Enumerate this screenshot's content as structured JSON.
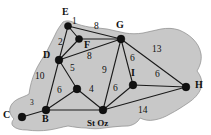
{
  "figure": {
    "type": "weighted-graph-map",
    "background_color": "#ffffff",
    "landmass_color": "#c8c8c8",
    "edge_color": "#1a1a1a",
    "node_color": "#111111",
    "width": 211,
    "height": 135
  },
  "graph": {
    "nodes": [
      {
        "id": "E",
        "label": "E",
        "x": 68,
        "y": 26,
        "label_x": 62,
        "label_y": 9,
        "r": 3.6
      },
      {
        "id": "F",
        "label": "F",
        "x": 79,
        "y": 39,
        "label_x": 84,
        "label_y": 42,
        "r": 3.6
      },
      {
        "id": "G",
        "label": "G",
        "x": 121,
        "y": 39,
        "label_x": 117,
        "label_y": 22,
        "r": 3.9
      },
      {
        "id": "D",
        "label": "D",
        "x": 59,
        "y": 60,
        "label_x": 44,
        "label_y": 52,
        "r": 3.9
      },
      {
        "id": "H",
        "label": "H",
        "x": 186,
        "y": 87,
        "label_x": 194,
        "label_y": 80,
        "r": 3.9
      },
      {
        "id": "I",
        "label": "I",
        "x": 133,
        "y": 85,
        "label_x": 131,
        "label_y": 70,
        "r": 3.9
      },
      {
        "id": "A",
        "label": "",
        "x": 77,
        "y": 89,
        "label_x": 0,
        "label_y": 0,
        "r": 3.9
      },
      {
        "id": "B",
        "label": "B",
        "x": 46,
        "y": 110,
        "label_x": 42,
        "label_y": 113,
        "r": 3.9
      },
      {
        "id": "C",
        "label": "C",
        "x": 22,
        "y": 117,
        "label_x": 4,
        "label_y": 110,
        "r": 3.9
      },
      {
        "id": "St Oz",
        "label": "St Oz",
        "x": 103,
        "y": 110,
        "label_x": 88,
        "label_y": 119,
        "r": 3.9
      }
    ],
    "edges": [
      {
        "from": "E",
        "to": "F",
        "weight": "1",
        "label_x": 72,
        "label_y": 21
      },
      {
        "from": "E",
        "to": "D",
        "weight": "2",
        "label_x": 60,
        "label_y": 42
      },
      {
        "from": "F",
        "to": "D",
        "weight": "",
        "label_x": 0,
        "label_y": 0
      },
      {
        "from": "F",
        "to": "G",
        "weight": "8",
        "label_x": 96,
        "label_y": 26
      },
      {
        "from": "D",
        "to": "G",
        "weight": "8",
        "label_x": 89,
        "label_y": 55
      },
      {
        "from": "G",
        "to": "H",
        "weight": "13",
        "label_x": 155,
        "label_y": 51
      },
      {
        "from": "G",
        "to": "I",
        "weight": "6",
        "label_x": 131,
        "label_y": 58
      },
      {
        "from": "G",
        "to": "St Oz",
        "weight": "9",
        "label_x": 104,
        "label_y": 71
      },
      {
        "from": "I",
        "to": "H",
        "weight": "6",
        "label_x": 157,
        "label_y": 74
      },
      {
        "from": "I",
        "to": "St Oz",
        "weight": "6",
        "label_x": 115,
        "label_y": 85
      },
      {
        "from": "St Oz",
        "to": "H",
        "weight": "14",
        "label_x": 141,
        "label_y": 110
      },
      {
        "from": "St Oz",
        "to": "A",
        "weight": "4",
        "label_x": 90,
        "label_y": 90
      },
      {
        "from": "A",
        "to": "D",
        "weight": "5",
        "label_x": 71,
        "label_y": 68
      },
      {
        "from": "A",
        "to": "B",
        "weight": "6",
        "label_x": 58,
        "label_y": 90
      },
      {
        "from": "B",
        "to": "D",
        "weight": "10",
        "label_x": 38,
        "label_y": 76
      },
      {
        "from": "B",
        "to": "C",
        "weight": "3",
        "label_x": 31,
        "label_y": 103
      }
    ]
  }
}
